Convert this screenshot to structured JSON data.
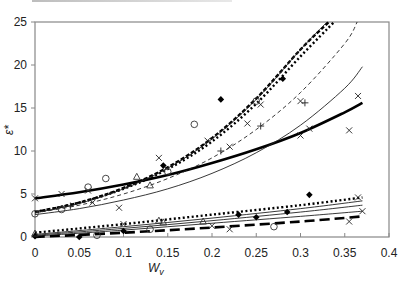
{
  "chart_data": {
    "type": "scatter",
    "title": "",
    "xlabel": "W",
    "xlabel_sub": "v",
    "ylabel": "ε*",
    "xlim": [
      0,
      0.4
    ],
    "ylim": [
      0,
      25
    ],
    "x_ticks": [
      "0",
      "0.05",
      "0.1",
      "0.15",
      "0.2",
      "0.25",
      "0.3",
      "0.35",
      "0.4"
    ],
    "x_tick_values": [
      0,
      0.05,
      0.1,
      0.15,
      0.2,
      0.25,
      0.3,
      0.35,
      0.4
    ],
    "y_ticks": [
      "0",
      "5",
      "10",
      "15",
      "20",
      "25"
    ],
    "y_tick_values": [
      0,
      5,
      10,
      15,
      20,
      25
    ],
    "grid": false,
    "legend": "none",
    "fit_curves": [
      {
        "name": "upper-thick-solid",
        "style": "thick-solid",
        "x": [
          0,
          0.05,
          0.1,
          0.15,
          0.2,
          0.25,
          0.3,
          0.35,
          0.37
        ],
        "y": [
          4.5,
          5.2,
          6.1,
          7.2,
          8.6,
          10.2,
          12.1,
          14.5,
          15.6
        ]
      },
      {
        "name": "upper-dotted",
        "style": "thick-dotted",
        "x": [
          0,
          0.05,
          0.1,
          0.15,
          0.2,
          0.25,
          0.3,
          0.338
        ],
        "y": [
          2.9,
          4.0,
          5.6,
          7.9,
          11.1,
          15.5,
          21.0,
          25.0
        ]
      },
      {
        "name": "upper-dashed-heavy",
        "style": "heavy-dashed",
        "x": [
          0,
          0.05,
          0.1,
          0.15,
          0.2,
          0.25,
          0.3,
          0.332
        ],
        "y": [
          2.9,
          4.0,
          5.7,
          8.1,
          11.5,
          16.1,
          21.8,
          25.0
        ]
      },
      {
        "name": "upper-thin-solid-steep",
        "style": "thin-solid",
        "x": [
          0,
          0.05,
          0.1,
          0.15,
          0.2,
          0.25,
          0.3,
          0.33
        ],
        "y": [
          2.8,
          3.9,
          5.6,
          8.0,
          11.4,
          16.0,
          21.8,
          25.0
        ]
      },
      {
        "name": "upper-thin-dashed",
        "style": "thin-dashed",
        "x": [
          0,
          0.05,
          0.1,
          0.15,
          0.2,
          0.25,
          0.3,
          0.35,
          0.364
        ],
        "y": [
          2.8,
          3.7,
          5.0,
          6.8,
          9.2,
          12.5,
          16.8,
          22.5,
          25.0
        ]
      },
      {
        "name": "upper-thin-solid",
        "style": "thin-solid",
        "x": [
          0,
          0.05,
          0.1,
          0.15,
          0.2,
          0.25,
          0.3,
          0.35,
          0.37
        ],
        "y": [
          2.6,
          3.3,
          4.3,
          5.6,
          7.4,
          9.8,
          13.0,
          17.3,
          19.8
        ]
      },
      {
        "name": "lower-dotted",
        "style": "thick-dotted",
        "x": [
          0,
          0.1,
          0.2,
          0.3,
          0.37
        ],
        "y": [
          0.5,
          1.5,
          2.6,
          3.7,
          4.6
        ]
      },
      {
        "name": "lower-thin-solid-1",
        "style": "thin-solid",
        "x": [
          0,
          0.1,
          0.2,
          0.3,
          0.37
        ],
        "y": [
          0.3,
          1.2,
          2.2,
          3.3,
          4.2
        ]
      },
      {
        "name": "lower-thin-solid-2",
        "style": "thin-solid",
        "x": [
          0,
          0.1,
          0.2,
          0.3,
          0.37
        ],
        "y": [
          0.2,
          1.0,
          1.9,
          2.9,
          3.7
        ]
      },
      {
        "name": "lower-thin-solid-3",
        "style": "thin-solid",
        "x": [
          0,
          0.1,
          0.2,
          0.3,
          0.37
        ],
        "y": [
          0.1,
          0.8,
          1.6,
          2.4,
          3.0
        ]
      },
      {
        "name": "lower-long-dashed",
        "style": "long-dashed",
        "x": [
          0,
          0.1,
          0.2,
          0.3,
          0.37
        ],
        "y": [
          0.0,
          0.5,
          1.1,
          1.8,
          2.4
        ]
      }
    ],
    "points": [
      {
        "marker": "x",
        "x": 0.0,
        "y": 4.5
      },
      {
        "marker": "x",
        "x": 0.03,
        "y": 5.0
      },
      {
        "marker": "x",
        "x": 0.06,
        "y": 5.4
      },
      {
        "marker": "o",
        "x": 0.08,
        "y": 6.8
      },
      {
        "marker": "x",
        "x": 0.095,
        "y": 3.4
      },
      {
        "marker": "o",
        "x": 0.06,
        "y": 5.8
      },
      {
        "marker": "x",
        "x": 0.14,
        "y": 9.2
      },
      {
        "marker": "o",
        "x": 0.15,
        "y": 7.6
      },
      {
        "marker": "diamond",
        "x": 0.145,
        "y": 8.3
      },
      {
        "marker": "o",
        "x": 0.18,
        "y": 13.1
      },
      {
        "marker": "diamond",
        "x": 0.21,
        "y": 16.0
      },
      {
        "marker": "x",
        "x": 0.195,
        "y": 11.2
      },
      {
        "marker": "o",
        "x": 0.25,
        "y": 15.8
      },
      {
        "marker": "x",
        "x": 0.255,
        "y": 15.4
      },
      {
        "marker": "x",
        "x": 0.24,
        "y": 13.2
      },
      {
        "marker": "plus",
        "x": 0.255,
        "y": 12.9
      },
      {
        "marker": "x",
        "x": 0.3,
        "y": 15.8
      },
      {
        "marker": "plus",
        "x": 0.305,
        "y": 15.6
      },
      {
        "marker": "x",
        "x": 0.22,
        "y": 10.5
      },
      {
        "marker": "x",
        "x": 0.3,
        "y": 11.8
      },
      {
        "marker": "x",
        "x": 0.31,
        "y": 12.6
      },
      {
        "marker": "x",
        "x": 0.355,
        "y": 12.4
      },
      {
        "marker": "x",
        "x": 0.365,
        "y": 16.4
      },
      {
        "marker": "diamond",
        "x": 0.28,
        "y": 18.4
      },
      {
        "marker": "plus",
        "x": 0.21,
        "y": 10.0
      },
      {
        "marker": "triangle",
        "x": 0.115,
        "y": 7.0
      },
      {
        "marker": "o",
        "x": 0.0,
        "y": 2.7
      },
      {
        "marker": "o",
        "x": 0.03,
        "y": 3.2
      },
      {
        "marker": "x",
        "x": 0.065,
        "y": 4.0
      },
      {
        "marker": "plus",
        "x": 0.04,
        "y": 3.6
      },
      {
        "marker": "triangle",
        "x": 0.13,
        "y": 6.0
      },
      {
        "marker": "triangle",
        "x": 0.19,
        "y": 1.8
      },
      {
        "marker": "x",
        "x": 0.2,
        "y": 1.3
      },
      {
        "marker": "triangle",
        "x": 0.14,
        "y": 1.9
      },
      {
        "marker": "triangle",
        "x": 0.145,
        "y": 1.7
      },
      {
        "marker": "diamond",
        "x": 0.25,
        "y": 2.3
      },
      {
        "marker": "diamond",
        "x": 0.23,
        "y": 2.6
      },
      {
        "marker": "diamond",
        "x": 0.31,
        "y": 4.9
      },
      {
        "marker": "diamond",
        "x": 0.285,
        "y": 2.9
      },
      {
        "marker": "x",
        "x": 0.22,
        "y": 0.9
      },
      {
        "marker": "o",
        "x": 0.27,
        "y": 1.2
      },
      {
        "marker": "x",
        "x": 0.355,
        "y": 1.8
      },
      {
        "marker": "x",
        "x": 0.37,
        "y": 3.0
      },
      {
        "marker": "x",
        "x": 0.365,
        "y": 4.6
      },
      {
        "marker": "o",
        "x": 0.07,
        "y": 0.2
      },
      {
        "marker": "diamond",
        "x": 0.1,
        "y": 0.7
      },
      {
        "marker": "x",
        "x": 0.1,
        "y": 1.5
      },
      {
        "marker": "diamond",
        "x": 0.05,
        "y": 0.0
      },
      {
        "marker": "diamond",
        "x": 0.0,
        "y": 0.1
      },
      {
        "marker": "o",
        "x": 0.13,
        "y": 0.9
      },
      {
        "marker": "triangle",
        "x": 0.0,
        "y": 0.4
      }
    ]
  }
}
